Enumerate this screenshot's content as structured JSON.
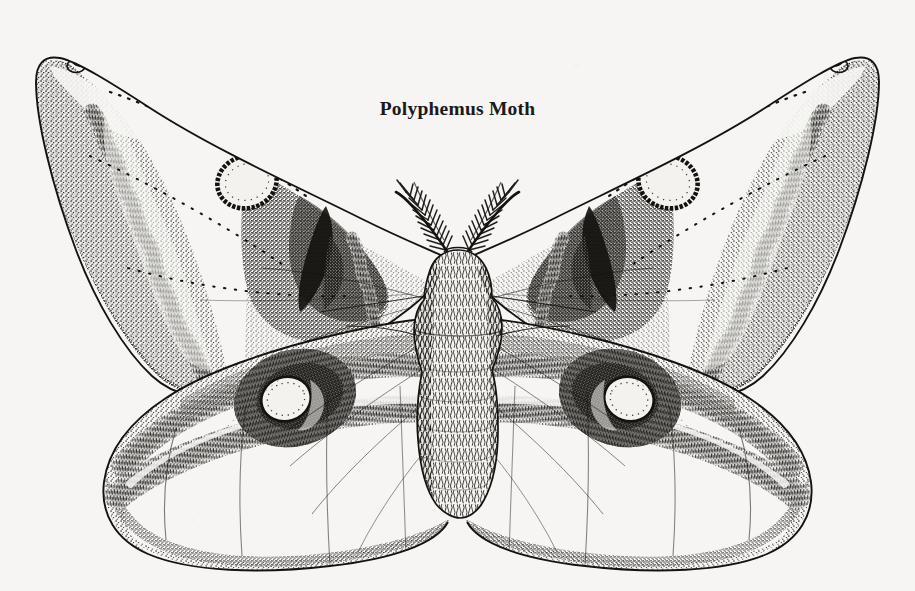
{
  "plate": {
    "title": "Polyphemus Moth",
    "medium": "pen-and-ink stipple illustration",
    "background_color": "#f6f5f3",
    "ink_color": "#15130f",
    "width": 915,
    "height": 591
  },
  "specimen": {
    "common_name": "Polyphemus Moth",
    "orientation": "dorsal, wings spread",
    "symmetry": "bilateral"
  },
  "anatomy": {
    "body": {
      "label": "body",
      "parts": [
        "head",
        "thorax",
        "abdomen"
      ],
      "texture": "dense wavy hair scales",
      "center_x": 458,
      "thorax_top_y": 248,
      "abdomen_bottom_y": 512
    },
    "antennae": {
      "label": "antennae",
      "type": "bipectinate feathery",
      "count": 2,
      "arrangement": "V-shaped, angled upward and outward"
    },
    "forewings": {
      "label": "forewings",
      "count": 2,
      "features": [
        "pale apical patch with dark apical spot",
        "dark wavy medial streak",
        "small round translucent eyespot",
        "stippled gray shading toward the costa",
        "dotted postmedial vein line"
      ]
    },
    "hindwings": {
      "label": "hindwings",
      "count": 2,
      "features": [
        "large dark ocellus with pale oval center",
        "thick dark submarginal band",
        "broad stippled gray marginal band",
        "fine radiating vein lines"
      ]
    }
  },
  "markings": {
    "forewing_eyespot": {
      "name": "forewing eyespot",
      "shape": "small oval ring",
      "ring_color": "#15130f",
      "center_color": "#f4f2ef"
    },
    "hindwing_eyespot": {
      "name": "hindwing eyespot",
      "shape": "large oval ring with inner crescent",
      "ring_color": "#15130f",
      "center_color": "#f4f2ef"
    },
    "apical_spot": {
      "name": "apical spot",
      "shape": "small solid dark blotch near wing tip",
      "color": "#15130f"
    },
    "submarginal_band": {
      "name": "submarginal band",
      "color": "#15130f"
    },
    "marginal_band": {
      "name": "marginal band",
      "color": "#8a8884"
    }
  }
}
